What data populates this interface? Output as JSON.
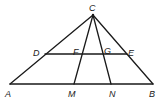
{
  "diagram": {
    "title": "",
    "points": {
      "C": {
        "label": "C",
        "x": 93,
        "y": 15
      },
      "A": {
        "label": "A",
        "x": 10,
        "y": 84
      },
      "B": {
        "label": "B",
        "x": 153,
        "y": 84
      },
      "M": {
        "label": "M",
        "x": 74,
        "y": 84
      },
      "N": {
        "label": "N",
        "x": 111,
        "y": 84
      },
      "D": {
        "label": "D",
        "x": 45,
        "y": 54
      },
      "E": {
        "label": "E",
        "x": 127,
        "y": 54
      },
      "F": {
        "label": "F",
        "x": 83,
        "y": 54
      },
      "G": {
        "label": "G",
        "x": 102,
        "y": 54
      }
    },
    "segments": [
      "CA",
      "CB",
      "AB",
      "CM",
      "CN",
      "DE"
    ],
    "labels": {
      "C": "C",
      "D": "D",
      "F": "F",
      "G": "G",
      "E": "E",
      "A": "A",
      "M": "M",
      "N": "N",
      "B": "B"
    },
    "colors": {
      "stroke": "#1a1a1a",
      "background": "#ffffff"
    }
  }
}
